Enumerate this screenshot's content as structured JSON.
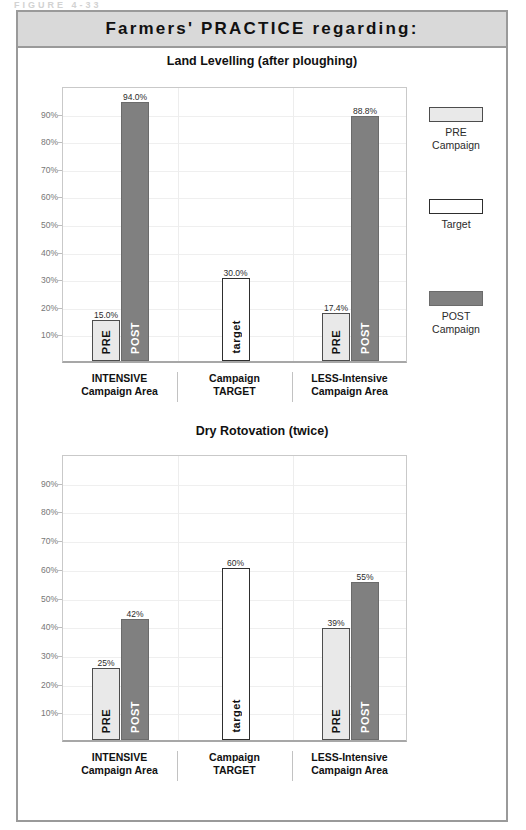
{
  "figure_caption": "FIGURE  4-33",
  "banner": {
    "title": "Farmers' PRACTICE regarding:"
  },
  "legend": {
    "items": [
      {
        "swatch": "pre",
        "line1": "PRE",
        "line2": "Campaign",
        "color": "#e9e9e9"
      },
      {
        "swatch": "target",
        "line1": "Target",
        "line2": "",
        "color": "#ffffff"
      },
      {
        "swatch": "post",
        "line1": "POST",
        "line2": "Campaign",
        "color": "#808080"
      }
    ]
  },
  "chart_data": [
    {
      "type": "bar",
      "title": "Land Levelling (after ploughing)",
      "xlabel": "",
      "ylabel": "",
      "ylim": [
        0,
        100
      ],
      "yticks": [
        "10%",
        "20%",
        "30%",
        "40%",
        "50%",
        "60%",
        "70%",
        "80%",
        "90%"
      ],
      "ytick_values": [
        10,
        20,
        30,
        40,
        50,
        60,
        70,
        80,
        90
      ],
      "grid": true,
      "legend_position": "right",
      "categories": [
        "INTENSIVE Campaign Area",
        "Campaign TARGET",
        "LESS-Intensive Campaign Area"
      ],
      "category_lines": [
        [
          "INTENSIVE",
          "Campaign Area"
        ],
        [
          "Campaign",
          "TARGET"
        ],
        [
          "LESS-Intensive",
          "Campaign Area"
        ]
      ],
      "bars": [
        {
          "group": 0,
          "series": "PRE",
          "label": "PRE",
          "value": 15.0,
          "value_label": "15.0%"
        },
        {
          "group": 0,
          "series": "POST",
          "label": "POST",
          "value": 94.0,
          "value_label": "94.0%"
        },
        {
          "group": 1,
          "series": "Target",
          "label": "target",
          "value": 30.0,
          "value_label": "30.0%"
        },
        {
          "group": 2,
          "series": "PRE",
          "label": "PRE",
          "value": 17.4,
          "value_label": "17.4%"
        },
        {
          "group": 2,
          "series": "POST",
          "label": "POST",
          "value": 88.8,
          "value_label": "88.8%"
        }
      ]
    },
    {
      "type": "bar",
      "title": "Dry Rotovation (twice)",
      "xlabel": "",
      "ylabel": "",
      "ylim": [
        0,
        100
      ],
      "yticks": [
        "10%",
        "20%",
        "30%",
        "40%",
        "50%",
        "60%",
        "70%",
        "80%",
        "90%"
      ],
      "ytick_values": [
        10,
        20,
        30,
        40,
        50,
        60,
        70,
        80,
        90
      ],
      "grid": true,
      "legend_position": "none",
      "categories": [
        "INTENSIVE Campaign Area",
        "Campaign TARGET",
        "LESS-Intensive Campaign Area"
      ],
      "category_lines": [
        [
          "INTENSIVE",
          "Campaign Area"
        ],
        [
          "Campaign",
          "TARGET"
        ],
        [
          "LESS-Intensive",
          "Campaign Area"
        ]
      ],
      "bars": [
        {
          "group": 0,
          "series": "PRE",
          "label": "PRE",
          "value": 25.0,
          "value_label": "25%"
        },
        {
          "group": 0,
          "series": "POST",
          "label": "POST",
          "value": 42.0,
          "value_label": "42%"
        },
        {
          "group": 1,
          "series": "Target",
          "label": "target",
          "value": 60.0,
          "value_label": "60%"
        },
        {
          "group": 2,
          "series": "PRE",
          "label": "PRE",
          "value": 39.0,
          "value_label": "39%"
        },
        {
          "group": 2,
          "series": "POST",
          "label": "POST",
          "value": 55.0,
          "value_label": "55%"
        }
      ]
    }
  ],
  "colors": {
    "pre": "#e9e9e9",
    "post": "#808080",
    "target": "#ffffff",
    "banner_bg": "#d9d9d9",
    "frame": "#9a9a9a"
  }
}
